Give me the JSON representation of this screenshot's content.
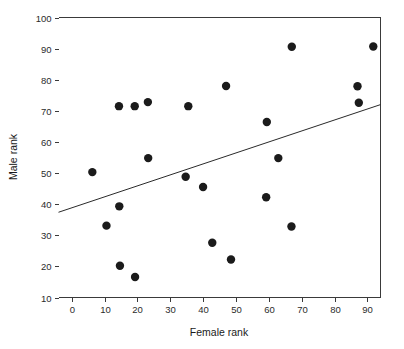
{
  "chart_data": {
    "type": "scatter",
    "title": "",
    "subtitle": "",
    "xlabel": "Female rank",
    "ylabel": "Male rank",
    "xlim": [
      -4,
      94
    ],
    "ylim": [
      10,
      100
    ],
    "xticks": [
      0,
      10,
      20,
      30,
      40,
      50,
      60,
      70,
      80,
      90
    ],
    "yticks": [
      10,
      20,
      30,
      40,
      50,
      60,
      70,
      80,
      90,
      100
    ],
    "xtick_labels": [
      "0",
      "10",
      "20",
      "30",
      "40",
      "50",
      "60",
      "70",
      "80",
      "90"
    ],
    "ytick_labels": [
      "10",
      "20",
      "30",
      "40",
      "50",
      "60",
      "70",
      "80",
      "90",
      "100"
    ],
    "grid": false,
    "legend": null,
    "marker": {
      "shape": "circle",
      "color": "#1b1b1b",
      "size": 4.2
    },
    "points": [
      {
        "x": 6.3,
        "y": 50.3
      },
      {
        "x": 10.6,
        "y": 33.1
      },
      {
        "x": 14.4,
        "y": 71.5
      },
      {
        "x": 14.5,
        "y": 39.3
      },
      {
        "x": 14.7,
        "y": 20.2
      },
      {
        "x": 19.2,
        "y": 71.5
      },
      {
        "x": 19.3,
        "y": 16.6
      },
      {
        "x": 23.2,
        "y": 72.8
      },
      {
        "x": 23.3,
        "y": 54.8
      },
      {
        "x": 34.7,
        "y": 48.8
      },
      {
        "x": 35.5,
        "y": 71.5
      },
      {
        "x": 40.0,
        "y": 45.5
      },
      {
        "x": 42.8,
        "y": 27.6
      },
      {
        "x": 47.0,
        "y": 78.0
      },
      {
        "x": 48.5,
        "y": 22.2
      },
      {
        "x": 59.2,
        "y": 42.2
      },
      {
        "x": 59.4,
        "y": 66.4
      },
      {
        "x": 62.9,
        "y": 54.8
      },
      {
        "x": 66.9,
        "y": 32.8
      },
      {
        "x": 67.0,
        "y": 90.6
      },
      {
        "x": 87.0,
        "y": 77.9
      },
      {
        "x": 87.4,
        "y": 72.6
      },
      {
        "x": 91.8,
        "y": 90.7
      }
    ],
    "fit_line": {
      "type": "linear-regression",
      "x_start": -4,
      "y_start": 37.4,
      "x_end": 94,
      "y_end": 72.0,
      "color": "#2a2a2a"
    }
  },
  "figure": {
    "background_color": "#ffffff",
    "axis_color": "#3a3a3a"
  }
}
